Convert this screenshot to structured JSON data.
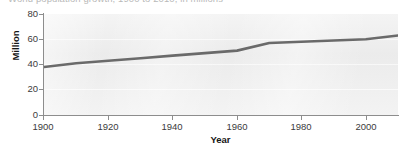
{
  "figure": {
    "title_clipped": "World population growth, 1900 to 2010, in millions"
  },
  "axes": {
    "ylabel": "Million",
    "xlabel": "Year",
    "yticks": [
      "80",
      "60",
      "40",
      "20",
      "0"
    ],
    "xticks": [
      "1900",
      "1920",
      "1940",
      "1960",
      "1980",
      "2000"
    ]
  },
  "colors": {
    "line": "#6a6a6a",
    "plot_background": "#efefef",
    "gridline": "#fbfbfb",
    "axis": "#8d8d8d",
    "tick_text": "#3b3b3b",
    "label_text": "#161616"
  },
  "chart_data": {
    "type": "line",
    "title": "World population growth, 1900 to 2010, in millions",
    "xlabel": "Year",
    "ylabel": "Million",
    "xlim": [
      1900,
      2010
    ],
    "ylim": [
      0,
      80
    ],
    "xticks": [
      1900,
      1920,
      1940,
      1960,
      1980,
      2000
    ],
    "yticks": [
      0,
      20,
      40,
      60,
      80
    ],
    "grid": true,
    "legend": "none",
    "series": [
      {
        "name": "Population",
        "x": [
          1900,
          1910,
          1920,
          1930,
          1940,
          1950,
          1960,
          1970,
          1980,
          1990,
          2000,
          2010
        ],
        "values": [
          38,
          41,
          43,
          45,
          47,
          49,
          51,
          57,
          58,
          59,
          60,
          63
        ]
      }
    ]
  }
}
